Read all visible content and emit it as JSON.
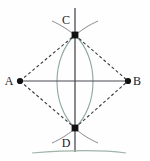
{
  "figure": {
    "width": 150,
    "height": 161,
    "background_color": "#fefefe",
    "colors": {
      "segment": "#4a4a52",
      "dashed": "#3a3a42",
      "arc": "#8aa89c",
      "point": "#111111",
      "label": "#1a1a1a",
      "ground_line": "#9fb3a8"
    },
    "points": [
      {
        "id": "A",
        "label": "A",
        "x": 20,
        "y": 81,
        "label_x": 9,
        "label_y": 85,
        "dot_r": 3.1
      },
      {
        "id": "B",
        "label": "B",
        "x": 128,
        "y": 81,
        "label_x": 134,
        "label_y": 85,
        "dot_r": 3.1
      },
      {
        "id": "C",
        "label": "C",
        "x": 75,
        "y": 35,
        "label_x": 66,
        "label_y": 24,
        "dot_r": 3.4
      },
      {
        "id": "D",
        "label": "D",
        "x": 75,
        "y": 128,
        "label_x": 66,
        "label_y": 147,
        "dot_r": 3.4
      }
    ],
    "segments": [
      {
        "name": "segment-AB",
        "x1": 20,
        "y1": 81,
        "x2": 128,
        "y2": 81,
        "style": "solid"
      },
      {
        "name": "line-CD-vertical",
        "x1": 75,
        "y1": 8,
        "x2": 75,
        "y2": 152,
        "style": "solid"
      }
    ],
    "dashed_segments": [
      {
        "name": "dashed-AC",
        "x1": 20,
        "y1": 81,
        "x2": 75,
        "y2": 35
      },
      {
        "name": "dashed-CB",
        "x1": 75,
        "y1": 35,
        "x2": 128,
        "y2": 81
      },
      {
        "name": "dashed-AD",
        "x1": 20,
        "y1": 81,
        "x2": 75,
        "y2": 128
      },
      {
        "name": "dashed-DB",
        "x1": 75,
        "y1": 128,
        "x2": 128,
        "y2": 81
      }
    ],
    "arcs": [
      {
        "name": "arc-from-A",
        "d": "M 75 35 C 51 58 51 105 75 128"
      },
      {
        "name": "arc-from-B",
        "d": "M 75 35 C 99 58 99 105 75 128"
      },
      {
        "name": "arc-tick-top-left",
        "d": "M 54 22 C 62 26 70 31 78 38"
      },
      {
        "name": "arc-tick-top-right",
        "d": "M 96 22 C 88 26 80 31 72 38"
      },
      {
        "name": "arc-tick-bottom-left",
        "d": "M 54 142 C 62 138 70 133 78 126"
      },
      {
        "name": "arc-tick-bottom-right",
        "d": "M 96 142 C 88 138 80 133 72 126"
      }
    ],
    "ground_line": {
      "name": "ground-line",
      "d": "M 32 153 C 70 150 104 150 126 153"
    }
  }
}
